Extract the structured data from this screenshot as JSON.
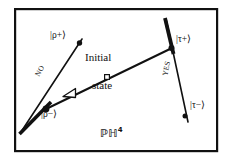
{
  "figure": {
    "background_color": "#ffffff",
    "ink_color": "#111111",
    "frame": {
      "x": 14,
      "y": 8,
      "width": 204,
      "height": 144,
      "stroke_width": 2.2
    }
  },
  "labels": {
    "rho_plus": "|ρ+⟩",
    "rho_minus": "|ρ−⟩",
    "tau_plus": "|τ+⟩",
    "tau_minus": "|τ−⟩",
    "no": "NO",
    "yes": "YES",
    "initial_line1": "Initial",
    "initial_line2": "state",
    "space_P": "ℙ",
    "space_H": "ℍ",
    "space_exp": "4",
    "space_full": "ℙℍ⁴"
  },
  "geometry": {
    "left_geodesic": {
      "name": "rho-geodesic",
      "x1": 21,
      "y1": 132,
      "x2": 82,
      "y2": 39,
      "stroke_width_thick": 3.4,
      "stroke_width_thin": 1.5,
      "thick_from_t": 0.0,
      "thick_to_t": 0.3
    },
    "right_geodesic": {
      "name": "tau-geodesic",
      "x1": 166,
      "y1": 19,
      "x2": 188,
      "y2": 122,
      "stroke_width_thick": 3.6,
      "stroke_width_thin": 1.5,
      "thick_from_t": 0.0,
      "thick_to_t": 0.31
    },
    "transition_line": {
      "name": "transition-geodesic",
      "x1": 46,
      "y1": 109,
      "x2": 172,
      "y2": 48,
      "stroke_width": 1.9
    },
    "nodes": {
      "rho_minus_node": {
        "x": 46,
        "y": 109,
        "r": 3.2,
        "fill": "solid"
      },
      "rho_plus_node": {
        "x": 79,
        "y": 43,
        "r": 2.6,
        "fill": "solid"
      },
      "tau_plus_node": {
        "x": 172,
        "y": 48,
        "r": 3.0,
        "fill": "solid"
      },
      "tau_minus_node": {
        "x": 185,
        "y": 116,
        "r": 2.4,
        "fill": "solid"
      },
      "initial_state_marker": {
        "x": 107,
        "y": 77,
        "size": 4.4,
        "fill": "open"
      },
      "arrow_marker": {
        "x": 72,
        "y": 93,
        "size": 7.5,
        "fill": "open",
        "angle": 205
      }
    }
  },
  "label_positions": {
    "rho_plus": {
      "x": 53,
      "y": 37
    },
    "rho_minus": {
      "x": 44,
      "y": 115
    },
    "tau_plus": {
      "x": 176,
      "y": 41
    },
    "tau_minus": {
      "x": 189,
      "y": 106
    },
    "no": {
      "x": 41,
      "y": 72,
      "rotation": -62
    },
    "yes": {
      "x": 166,
      "y": 66,
      "rotation": -76
    },
    "initial_line1": {
      "x": 86,
      "y": 58
    },
    "initial_line2": {
      "x": 92,
      "y": 80
    },
    "space": {
      "x": 101,
      "y": 127
    }
  }
}
